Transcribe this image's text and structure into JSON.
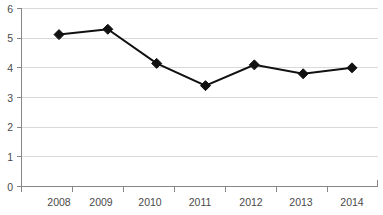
{
  "chart_data": {
    "type": "line",
    "title": "",
    "subtitle": "",
    "xlabel": "",
    "ylabel": "",
    "categories": [
      "2008",
      "2009",
      "2010",
      "2011",
      "2012",
      "2013",
      "2014"
    ],
    "values": [
      5.12,
      5.3,
      4.15,
      3.4,
      4.1,
      3.8,
      4.0
    ],
    "series": [
      {
        "name": "",
        "values": [
          5.12,
          5.3,
          4.15,
          3.4,
          4.1,
          3.8,
          4.0
        ]
      }
    ],
    "ylim": [
      0,
      6
    ],
    "ytick_labels": [
      "0",
      "1",
      "2",
      "3",
      "4",
      "5",
      "6"
    ],
    "ytick_values": [
      0,
      1,
      2,
      3,
      4,
      5,
      6
    ],
    "xtick_labels": [
      "2008",
      "2009",
      "2010",
      "2011",
      "2012",
      "2013",
      "2014"
    ],
    "grid": true,
    "grid_axis": "y",
    "legend": false,
    "legend_position": "none",
    "marker": "diamond",
    "annotations": []
  },
  "colors": {
    "background": "#ffffff",
    "series_line": "#111111",
    "marker_fill": "#111111",
    "gridline": "#d9d9d9",
    "axis": "#868686",
    "tick_text": "#4a4a4a"
  },
  "axes": {
    "y_axis_name": "value-axis",
    "x_axis_name": "year-axis"
  }
}
